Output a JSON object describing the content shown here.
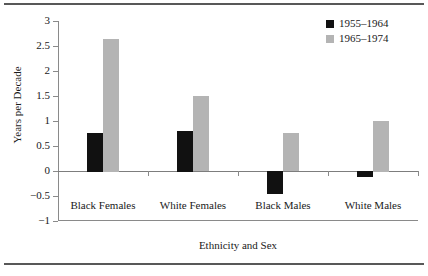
{
  "chart_data": {
    "type": "bar",
    "title": "",
    "xlabel": "Ethnicity and Sex",
    "ylabel": "Years per Decade",
    "categories": [
      "Black Females",
      "White Females",
      "Black Males",
      "White Males"
    ],
    "series": [
      {
        "name": "1955–1964",
        "color": "#111111",
        "values": [
          0.77,
          0.81,
          -0.45,
          -0.12
        ]
      },
      {
        "name": "1965–1974",
        "color": "#b4b4b4",
        "values": [
          2.65,
          1.5,
          0.76,
          1.01
        ]
      }
    ],
    "ylim": [
      -1,
      3
    ],
    "ytick_values": [
      3,
      2.5,
      2,
      1.5,
      1,
      0.5,
      0,
      -0.5,
      -1
    ],
    "ytick_labels": [
      "3",
      "2.5",
      "2",
      "1.5",
      "1",
      "0.5",
      "0",
      "−0.5",
      "−1"
    ],
    "grid": false,
    "legend_position": "top-right",
    "zero_line": 0
  },
  "legend": {
    "items": [
      {
        "label": "1955–1964",
        "swatch": "black-swatch"
      },
      {
        "label": "1965–1974",
        "swatch": "gray-swatch"
      }
    ]
  },
  "axes": {
    "y_title": "Years per Decade",
    "x_title": "Ethnicity and Sex"
  }
}
